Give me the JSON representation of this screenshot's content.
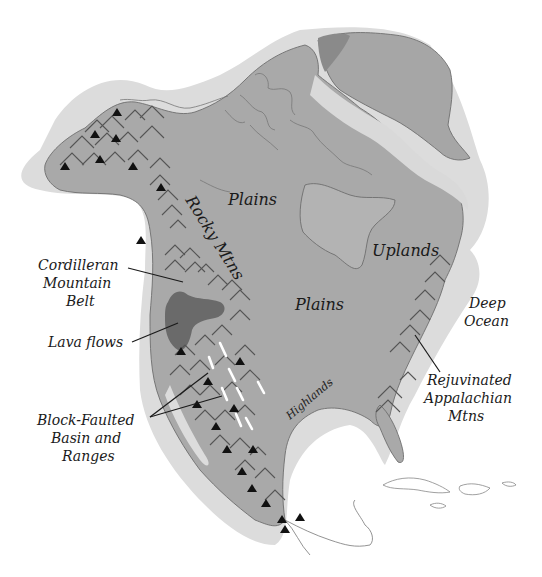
{
  "map": {
    "title": "North America physiographic regions",
    "colors": {
      "background": "#ffffff",
      "continental_shelf": "#dcdcdc",
      "land": "#a9a9a9",
      "lava_flows": "#6a6a6a",
      "mountain_symbol": "#555555",
      "volcano_symbol": "#111111",
      "fault_symbol": "#ffffff"
    },
    "labels": {
      "plains_north": "Plains",
      "plains_central": "Plains",
      "uplands": "Uplands",
      "rocky_mtns": "Rocky Mtns",
      "highlands": "Highlands",
      "deep_ocean_1": "Deep",
      "deep_ocean_2": "Ocean",
      "cordilleran_1": "Cordilleran",
      "cordilleran_2": "Mountain",
      "cordilleran_3": "Belt",
      "lava_flows": "Lava flows",
      "block_1": "Block-Faulted",
      "block_2": "Basin and",
      "block_3": "Ranges",
      "rejuv_1": "Rejuvinated",
      "rejuv_2": "Appalachian",
      "rejuv_3": "Mtns"
    },
    "legend_symbols": [
      {
        "name": "mountains",
        "glyph": "chevron"
      },
      {
        "name": "volcanoes",
        "glyph": "triangle"
      },
      {
        "name": "block faults",
        "glyph": "white-dash"
      }
    ]
  }
}
